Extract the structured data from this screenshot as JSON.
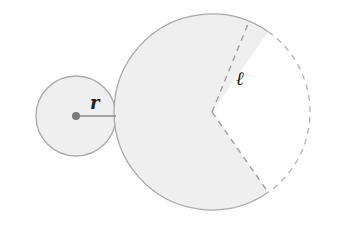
{
  "diagram": {
    "labels": {
      "radius": "r",
      "slant_height": "ℓ"
    },
    "colors": {
      "fill": "#efefef",
      "stroke": "#a9a9a9",
      "dashed": "#b5b5b5",
      "dot": "#7a7a7a",
      "radius_line": "#8c8c8c",
      "text": "#222222"
    },
    "base_circle": {
      "cx": 76,
      "cy": 116,
      "r": 40
    },
    "sector": {
      "cx": 212,
      "cy": 112,
      "r": 98,
      "gap_start_deg": -55,
      "gap_end_deg": 55
    }
  }
}
